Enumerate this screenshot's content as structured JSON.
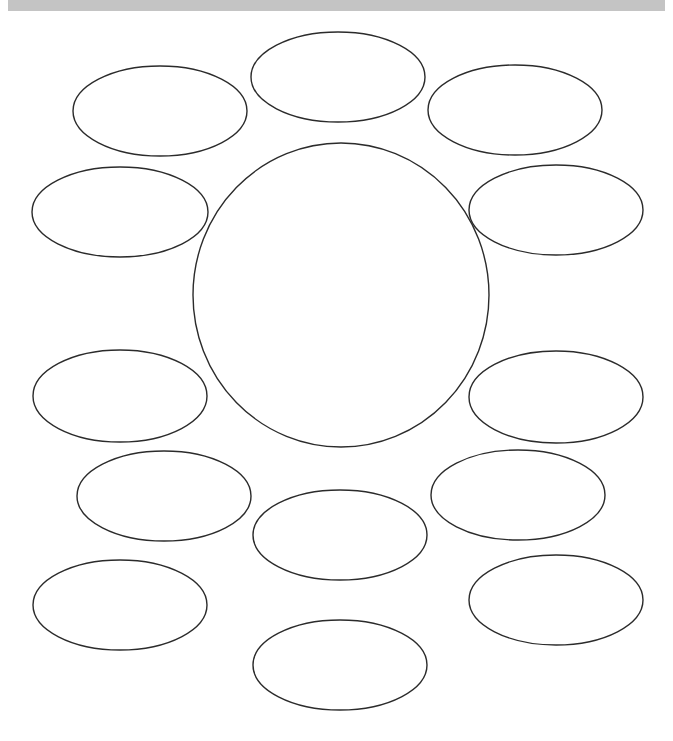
{
  "page": {
    "width": 673,
    "height": 741,
    "background_color": "#ffffff"
  },
  "header": {
    "band_color": "#c4c4c4",
    "label": ""
  },
  "style": {
    "shape_stroke_color": "#2b2b2b",
    "shape_fill_color": "#ffffff",
    "shape_stroke_width": 1.4
  },
  "chart_data": {
    "type": "diagram",
    "title": "",
    "subtitle": "",
    "grid": false,
    "legend": null,
    "xlabel": "",
    "ylabel": "",
    "shape_count": 13,
    "center_node": {
      "id": "center",
      "shape": "ellipse",
      "label": "",
      "cx": 341,
      "cy": 295,
      "rx": 148,
      "ry": 152
    },
    "satellite_nodes": [
      {
        "id": "top-center",
        "shape": "ellipse",
        "label": "",
        "cx": 338,
        "cy": 77,
        "rx": 87,
        "ry": 45
      },
      {
        "id": "top-left",
        "shape": "ellipse",
        "label": "",
        "cx": 160,
        "cy": 111,
        "rx": 87,
        "ry": 45
      },
      {
        "id": "top-right",
        "shape": "ellipse",
        "label": "",
        "cx": 515,
        "cy": 110,
        "rx": 87,
        "ry": 45
      },
      {
        "id": "upper-left",
        "shape": "ellipse",
        "label": "",
        "cx": 120,
        "cy": 212,
        "rx": 88,
        "ry": 45
      },
      {
        "id": "upper-right",
        "shape": "ellipse",
        "label": "",
        "cx": 556,
        "cy": 210,
        "rx": 87,
        "ry": 45
      },
      {
        "id": "lower-left",
        "shape": "ellipse",
        "label": "",
        "cx": 120,
        "cy": 396,
        "rx": 87,
        "ry": 46
      },
      {
        "id": "lower-right",
        "shape": "ellipse",
        "label": "",
        "cx": 556,
        "cy": 397,
        "rx": 87,
        "ry": 46
      },
      {
        "id": "bottom-left-upper",
        "shape": "ellipse",
        "label": "",
        "cx": 164,
        "cy": 496,
        "rx": 87,
        "ry": 45
      },
      {
        "id": "bottom-right-upper",
        "shape": "ellipse",
        "label": "",
        "cx": 518,
        "cy": 495,
        "rx": 87,
        "ry": 45
      },
      {
        "id": "bottom-center-mid",
        "shape": "ellipse",
        "label": "",
        "cx": 340,
        "cy": 535,
        "rx": 87,
        "ry": 45
      },
      {
        "id": "bottom-left",
        "shape": "ellipse",
        "label": "",
        "cx": 120,
        "cy": 605,
        "rx": 87,
        "ry": 45
      },
      {
        "id": "bottom-right",
        "shape": "ellipse",
        "label": "",
        "cx": 556,
        "cy": 600,
        "rx": 87,
        "ry": 45
      },
      {
        "id": "bottom-center",
        "shape": "ellipse",
        "label": "",
        "cx": 340,
        "cy": 665,
        "rx": 87,
        "ry": 45
      }
    ]
  }
}
